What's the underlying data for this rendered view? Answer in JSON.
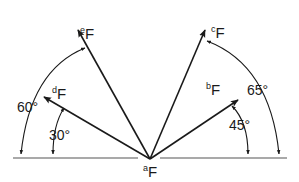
{
  "diagram": {
    "origin": {
      "label_sup": "a",
      "label_main": "F"
    },
    "vectors": [
      {
        "id": "e",
        "label_sup": "e",
        "label_main": "F",
        "angle_from_left": 60
      },
      {
        "id": "d",
        "label_sup": "d",
        "label_main": "F",
        "angle_from_left": 30
      },
      {
        "id": "c",
        "label_sup": "c",
        "label_main": "F",
        "angle_from_right": 65
      },
      {
        "id": "b",
        "label_sup": "b",
        "label_main": "F",
        "angle_from_right": 45
      }
    ],
    "angles": {
      "e": "60°",
      "d": "30°",
      "c": "65°",
      "b": "45°"
    },
    "colors": {
      "ink": "#1a1a1a",
      "background": "#ffffff"
    }
  }
}
